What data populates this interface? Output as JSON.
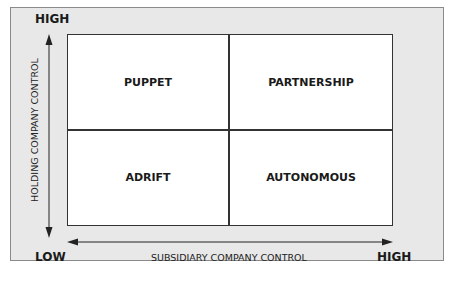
{
  "diagram": {
    "quadrants": {
      "top_left": "PUPPET",
      "top_right": "PARTNERSHIP",
      "bottom_left": "ADRIFT",
      "bottom_right": "AUTONOMOUS"
    },
    "y_axis": {
      "title": "HOLDING COMPANY CONTROL",
      "high": "HIGH"
    },
    "x_axis": {
      "title": "SUBSIDIARY COMPANY CONTROL",
      "high": "HIGH"
    },
    "origin_label": "LOW"
  },
  "colors": {
    "panel_bg": "#e8e8e8",
    "box_bg": "#ffffff",
    "lines": "#333333"
  }
}
